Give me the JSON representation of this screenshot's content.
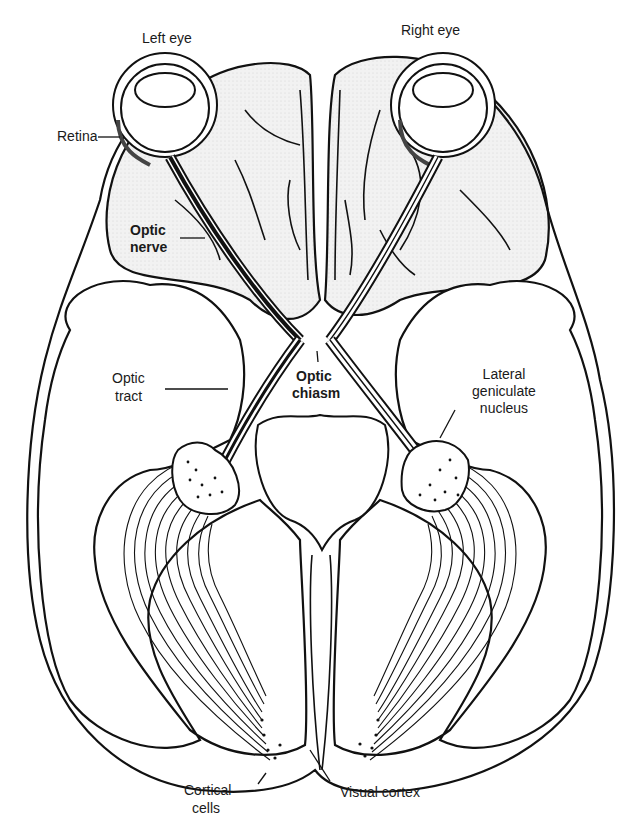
{
  "diagram": {
    "labels": {
      "left_eye": "Left eye",
      "right_eye": "Right eye",
      "retina": "Retina",
      "optic_nerve_1": "Optic",
      "optic_nerve_2": "nerve",
      "optic_tract_1": "Optic",
      "optic_tract_2": "tract",
      "optic_chiasm_1": "Optic",
      "optic_chiasm_2": "chiasm",
      "lgn_1": "Lateral",
      "lgn_2": "geniculate",
      "lgn_3": "nucleus",
      "cortical_cells_1": "Cortical",
      "cortical_cells_2": "cells",
      "visual_cortex": "Visual cortex"
    },
    "colors": {
      "line": "#111111",
      "brain_fill": "#ececec",
      "lobe_fill": "#ffffff"
    }
  }
}
